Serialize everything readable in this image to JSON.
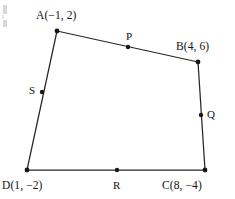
{
  "figure": {
    "name": "quadrilateral-midpoint-diagram",
    "shape_type": "quadrilateral",
    "stroke_color": "#2b2622",
    "point_color": "#1a1714",
    "background_color": "#ffffff"
  },
  "vertices": [
    {
      "key": "A",
      "label": "A(−1, 2)",
      "letter": "A",
      "coord_x": -1,
      "coord_y": 2,
      "px": 57,
      "py": 31
    },
    {
      "key": "B",
      "label": "B(4, 6)",
      "letter": "B",
      "coord_x": 4,
      "coord_y": 6,
      "px": 198,
      "py": 62
    },
    {
      "key": "C",
      "label": "C(8, −4)",
      "letter": "C",
      "coord_x": 8,
      "coord_y": -4,
      "px": 205,
      "py": 170
    },
    {
      "key": "D",
      "label": "D(1, −2)",
      "letter": "D",
      "coord_x": 1,
      "coord_y": -2,
      "px": 27,
      "py": 170
    }
  ],
  "midpoints": [
    {
      "key": "P",
      "label": "P",
      "on_segment": "AB",
      "px": 128,
      "py": 47
    },
    {
      "key": "Q",
      "label": "Q",
      "on_segment": "BC",
      "px": 201,
      "py": 115
    },
    {
      "key": "R",
      "label": "R",
      "on_segment": "DC",
      "px": 117,
      "py": 170
    },
    {
      "key": "S",
      "label": "S",
      "on_segment": "DA",
      "px": 42,
      "py": 92
    }
  ],
  "edges": [
    {
      "from": "A",
      "to": "B"
    },
    {
      "from": "B",
      "to": "C"
    },
    {
      "from": "C",
      "to": "D"
    },
    {
      "from": "D",
      "to": "A"
    }
  ]
}
